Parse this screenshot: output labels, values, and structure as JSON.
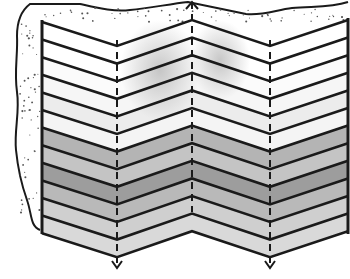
{
  "figure": {
    "width": 350,
    "height": 279,
    "caption": ""
  },
  "geometry": {
    "fold_x": [
      42,
      117,
      192,
      270,
      348
    ],
    "top_y": [
      22,
      46,
      20,
      46,
      20
    ],
    "line_count": 13,
    "spacing": 17.6
  },
  "layers": [
    {
      "fill": "#ffffff",
      "smudge": true
    },
    {
      "fill": "#ffffff",
      "smudge": true
    },
    {
      "fill": "#fbfbfb",
      "smudge": true
    },
    {
      "fill": "#f6f6f6",
      "smudge": true
    },
    {
      "fill": "#ececec",
      "smudge": false
    },
    {
      "fill": "#f4f4f4",
      "smudge": false
    },
    {
      "fill": "#b4b4b4",
      "smudge": false
    },
    {
      "fill": "#c4c4c4",
      "smudge": false
    },
    {
      "fill": "#9d9d9d",
      "smudge": false
    },
    {
      "fill": "#b9b9b9",
      "smudge": false
    },
    {
      "fill": "#cfcfcf",
      "smudge": false
    },
    {
      "fill": "#d9d9d9",
      "smudge": false
    }
  ],
  "axes": [
    {
      "name": "left-trough-axis",
      "x": 117,
      "y1": 40,
      "y2": 268,
      "arrow": "down"
    },
    {
      "name": "crest-axis",
      "x": 192,
      "y1": 2,
      "y2": 212,
      "arrow": "up"
    },
    {
      "name": "right-trough-axis",
      "x": 270,
      "y1": 40,
      "y2": 268,
      "arrow": "down"
    }
  ],
  "colors": {
    "ink": "#1a1a1a",
    "soil_dots": "#555555",
    "background": "#ffffff"
  }
}
